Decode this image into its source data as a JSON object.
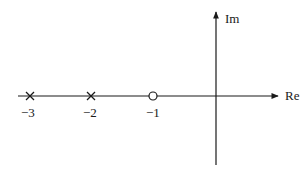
{
  "diagram": {
    "type": "pole-zero plot",
    "axes": {
      "real_label": "Re",
      "imag_label": "Im"
    },
    "poles": [
      {
        "value": -3,
        "marker": "x",
        "label": "−3"
      },
      {
        "value": -2,
        "marker": "x",
        "label": "−2"
      }
    ],
    "zeros": [
      {
        "value": -1,
        "marker": "o",
        "label": "−1"
      }
    ],
    "colors": {
      "line": "#1a1a1a",
      "background": "#ffffff"
    }
  }
}
